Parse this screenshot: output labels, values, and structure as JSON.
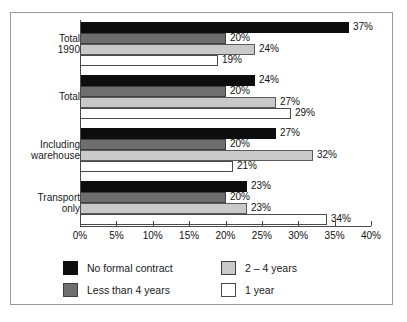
{
  "chart_data": {
    "type": "bar",
    "orientation": "horizontal",
    "title": "",
    "xlabel": "",
    "ylabel": "",
    "xlim": [
      0,
      40
    ],
    "xunit": "%",
    "grid": false,
    "legend_position": "bottom",
    "categories": [
      "Total\n1990",
      "Total",
      "Including\nwarehouse",
      "Transport\nonly"
    ],
    "tick_labels": [
      "0%",
      "5%",
      "10%",
      "15%",
      "20%",
      "25%",
      "30%",
      "35%",
      "40%"
    ],
    "tick_values": [
      0,
      5,
      10,
      15,
      20,
      25,
      30,
      35,
      40
    ],
    "series": [
      {
        "name": "No formal contract",
        "color": "#0d0d0d",
        "values": [
          37,
          24,
          27,
          23
        ],
        "labels": [
          "37%",
          "24%",
          "27%",
          "23%"
        ]
      },
      {
        "name": "Less than 4 years",
        "color": "#6e6e6e",
        "values": [
          20,
          20,
          20,
          20
        ],
        "labels": [
          "20%",
          "20%",
          "20%",
          "20%"
        ]
      },
      {
        "name": "2 – 4 years",
        "color": "#c9c9c9",
        "values": [
          24,
          27,
          32,
          23
        ],
        "labels": [
          "24%",
          "27%",
          "32%",
          "23%"
        ]
      },
      {
        "name": "1 year",
        "color": "#ffffff",
        "values": [
          19,
          29,
          21,
          34
        ],
        "labels": [
          "19%",
          "29%",
          "21%",
          "34%"
        ]
      }
    ],
    "legend": [
      {
        "label": "No formal contract",
        "color": "#0d0d0d"
      },
      {
        "label": "2 – 4 years",
        "color": "#c9c9c9"
      },
      {
        "label": "Less than 4 years",
        "color": "#6e6e6e"
      },
      {
        "label": "1 year",
        "color": "#ffffff"
      }
    ]
  }
}
